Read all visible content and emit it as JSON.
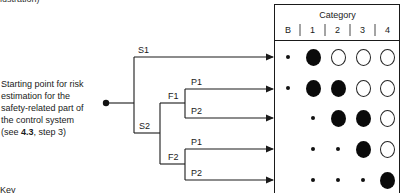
{
  "top_fragment": "lustration)",
  "start_label": {
    "lines": [
      "Starting point for risk",
      "estimation for the",
      "safety-related part of",
      "the control system"
    ],
    "ref_prefix": "(see ",
    "ref_bold": "4.3",
    "ref_suffix": ", step 3)"
  },
  "branches": {
    "s1": "S1",
    "s2": "S2",
    "f1": "F1",
    "f2": "F2",
    "f1_p1": "P1",
    "f1_p2": "P2",
    "f2_p1": "P1",
    "f2_p2": "P2"
  },
  "table": {
    "title": "Category",
    "columns": [
      "B",
      "1",
      "2",
      "3",
      "4"
    ],
    "rows": [
      {
        "path": "S1",
        "cells": [
          "small",
          "large-filled",
          "large-open",
          "large-open",
          "large-open"
        ]
      },
      {
        "path": "S2-F1-P1",
        "cells": [
          "small",
          "large-filled",
          "large-filled",
          "large-open",
          "large-open"
        ]
      },
      {
        "path": "S2-F1-P2",
        "cells": [
          "none",
          "small",
          "large-filled",
          "large-filled",
          "large-open"
        ]
      },
      {
        "path": "S2-F2-P1",
        "cells": [
          "none",
          "small",
          "small",
          "large-filled",
          "large-open"
        ]
      },
      {
        "path": "S2-F2-P2",
        "cells": [
          "none",
          "small",
          "small",
          "small",
          "large-filled"
        ]
      }
    ]
  },
  "key_label": "Key",
  "colors": {
    "line": "#1a1a1a",
    "background": "#ffffff"
  }
}
